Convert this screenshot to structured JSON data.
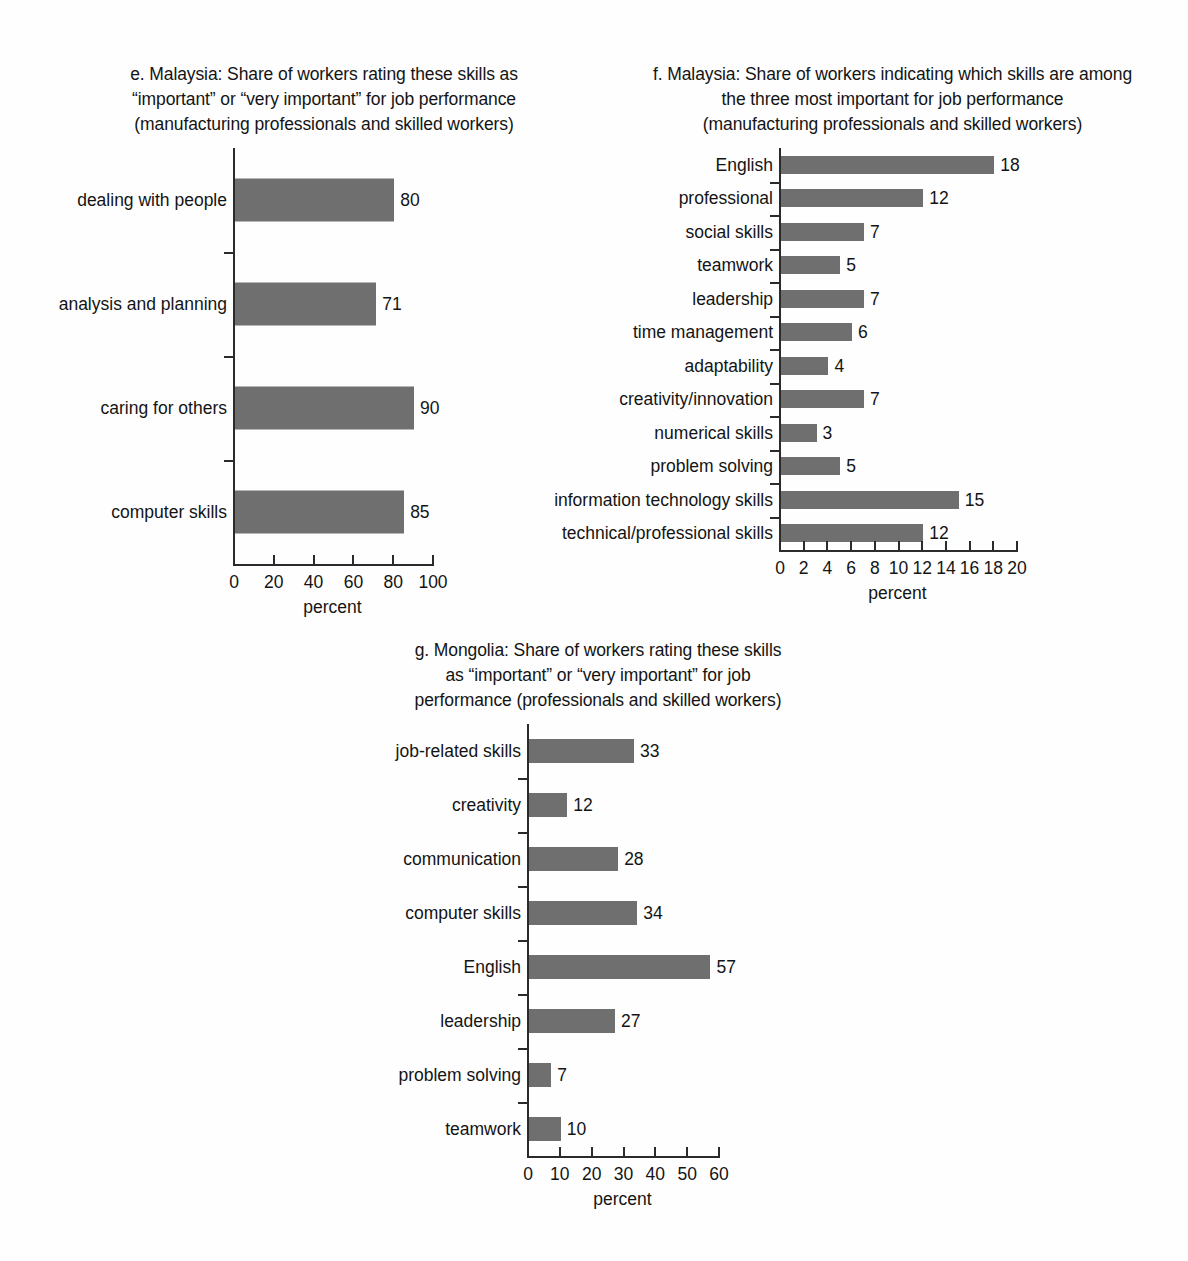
{
  "charts": [
    {
      "id": "chart-e",
      "panel_letter": "e",
      "title_lines": [
        "e. Malaysia: Share of workers rating these skills as",
        "“important” or “very important” for job performance",
        "(manufacturing professionals and skilled workers)"
      ],
      "chart_data": {
        "type": "bar",
        "orientation": "horizontal",
        "title": "e. Malaysia: Share of workers rating these skills as “important” or “very important” for job performance (manufacturing professionals and skilled workers)",
        "categories": [
          "dealing with people",
          "analysis and planning",
          "caring for others",
          "computer skills"
        ],
        "values": [
          80,
          71,
          90,
          85
        ],
        "xlabel": "percent",
        "ylabel": "",
        "xlim": [
          0,
          100
        ],
        "xticks": [
          0,
          20,
          40,
          60,
          80,
          100
        ],
        "xtick_labels": [
          "0",
          "20",
          "40",
          "60",
          "80",
          "100"
        ],
        "grid": false,
        "legend": false,
        "bar_color": "#6f6f6f"
      }
    },
    {
      "id": "chart-f",
      "panel_letter": "f",
      "title_lines": [
        "f. Malaysia: Share of workers indicating which skills are among",
        "the three most important for job performance",
        "(manufacturing professionals and skilled workers)"
      ],
      "chart_data": {
        "type": "bar",
        "orientation": "horizontal",
        "title": "f. Malaysia: Share of workers indicating which skills are among the three most important for job performance (manufacturing professionals and skilled workers)",
        "categories": [
          "English",
          "professional",
          "social skills",
          "teamwork",
          "leadership",
          "time management",
          "adaptability",
          "creativity/innovation",
          "numerical skills",
          "problem solving",
          "information technology skills",
          "technical/professional skills"
        ],
        "values": [
          18,
          12,
          7,
          5,
          7,
          6,
          4,
          7,
          3,
          5,
          15,
          12
        ],
        "xlabel": "percent",
        "ylabel": "",
        "xlim": [
          0,
          20
        ],
        "xticks": [
          0,
          2,
          4,
          6,
          8,
          10,
          12,
          14,
          16,
          18,
          20
        ],
        "xtick_labels": [
          "0",
          "2",
          "4",
          "6",
          "8",
          "10",
          "12",
          "14",
          "16",
          "18",
          "20"
        ],
        "grid": false,
        "legend": false,
        "bar_color": "#6f6f6f"
      }
    },
    {
      "id": "chart-g",
      "panel_letter": "g",
      "title_lines": [
        "g. Mongolia: Share of workers rating these skills",
        "as “important” or “very important” for job",
        "performance (professionals and skilled workers)"
      ],
      "chart_data": {
        "type": "bar",
        "orientation": "horizontal",
        "title": "g. Mongolia: Share of workers rating these skills as “important” or “very important” for job performance (professionals and skilled workers)",
        "categories": [
          "job-related skills",
          "creativity",
          "communication",
          "computer skills",
          "English",
          "leadership",
          "problem solving",
          "teamwork"
        ],
        "values": [
          33,
          12,
          28,
          34,
          57,
          27,
          7,
          10
        ],
        "xlabel": "percent",
        "ylabel": "",
        "xlim": [
          0,
          60
        ],
        "xticks": [
          0,
          10,
          20,
          30,
          40,
          50,
          60
        ],
        "xtick_labels": [
          "0",
          "10",
          "20",
          "30",
          "40",
          "50",
          "60"
        ],
        "grid": false,
        "legend": false,
        "bar_color": "#6f6f6f"
      }
    }
  ]
}
